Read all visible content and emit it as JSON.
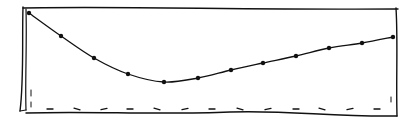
{
  "style": {
    "ink_color": "#111111",
    "background": "#ffffff"
  },
  "chart_data": {
    "type": "line",
    "title": "",
    "xlabel": "",
    "ylabel": "",
    "grid": false,
    "legend": null,
    "x": [
      0,
      1,
      2,
      3,
      4,
      5,
      6,
      7,
      8,
      9,
      10,
      11
    ],
    "series": [
      {
        "name": "curve",
        "values": [
          99,
          76,
          54,
          38,
          30,
          34,
          42,
          49,
          56,
          64,
          69,
          75
        ],
        "pixel_points": [
          [
            29,
            13
          ],
          [
            61,
            36
          ],
          [
            94,
            58
          ],
          [
            128,
            74
          ],
          [
            164,
            82
          ],
          [
            198,
            78
          ],
          [
            231,
            70
          ],
          [
            263,
            63
          ],
          [
            296,
            56
          ],
          [
            329,
            48
          ],
          [
            362,
            43
          ],
          [
            393,
            37
          ]
        ]
      }
    ],
    "ylim": [
      0,
      100
    ],
    "baseline_dashes_x": [
      50,
      77,
      104,
      130,
      157,
      185,
      212,
      240,
      268,
      296,
      322,
      350,
      377
    ],
    "baseline_dashes_y": 109
  }
}
